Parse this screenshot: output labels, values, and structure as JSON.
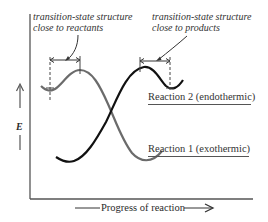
{
  "diagram": {
    "type": "energy-profile",
    "y_axis_label": "E",
    "x_axis_label": "Progress of reaction",
    "annotations": {
      "left": {
        "line1": "transition-state structure",
        "line2": "close to reactants"
      },
      "right": {
        "line1": "transition-state structure",
        "line2": "close to products"
      }
    },
    "series": [
      {
        "name": "Reaction 1 (exothermic)",
        "label": "Reaction 1 (exothermic)",
        "color": "#6b6b6b",
        "description": "starts high, small barrier early, ends low"
      },
      {
        "name": "Reaction 2 (endothermic)",
        "label": "Reaction 2 (endothermic)",
        "color": "#111111",
        "description": "starts low, barrier late, ends high"
      }
    ],
    "colors": {
      "axis": "#555555",
      "reaction1": "#6b6b6b",
      "reaction2": "#111111",
      "annotation": "#333333"
    }
  }
}
